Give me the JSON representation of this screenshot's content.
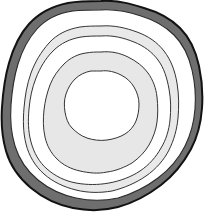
{
  "figure": {
    "width": 204,
    "height": 212,
    "background_color": "#ffffff"
  },
  "chart_data": {
    "type": "contour-rings",
    "xlabel": "",
    "ylabel": "",
    "center": [
      101,
      104
    ],
    "ring_count": 6,
    "outline_color": "#1a1a1a",
    "rings": [
      {
        "index": 0,
        "name": "outer-rind",
        "fill": "#6e6e6e",
        "stroke": "#121212",
        "stroke_width": 2.0,
        "mean_radius": 99,
        "radius_x": 99,
        "radius_y": 103,
        "roughness": "high",
        "label": "Outer rind"
      },
      {
        "index": 1,
        "name": "ring-1-white",
        "fill": "#ffffff",
        "stroke": "#2a2a2a",
        "stroke_width": 1.1,
        "mean_radius": 90,
        "radius_x": 90,
        "radius_y": 94,
        "roughness": "medium",
        "label": "Ring 1"
      },
      {
        "index": 2,
        "name": "ring-2-gray",
        "fill": "#e9e9e9",
        "stroke": "#333333",
        "stroke_width": 1.0,
        "mean_radius": 76,
        "radius_x": 76,
        "radius_y": 79,
        "roughness": "medium",
        "label": "Ring 2"
      },
      {
        "index": 3,
        "name": "ring-3-white",
        "fill": "#ffffff",
        "stroke": "#333333",
        "stroke_width": 1.0,
        "mean_radius": 66,
        "radius_x": 66,
        "radius_y": 69,
        "roughness": "low",
        "label": "Ring 3"
      },
      {
        "index": 4,
        "name": "ring-4-gray",
        "fill": "#e7e7e7",
        "stroke": "#333333",
        "stroke_width": 1.0,
        "mean_radius": 52,
        "radius_x": 52,
        "radius_y": 55,
        "roughness": "low",
        "label": "Ring 4"
      },
      {
        "index": 5,
        "name": "core-white",
        "fill": "#ffffff",
        "stroke": "#333333",
        "stroke_width": 1.0,
        "mean_radius": 33,
        "radius_x": 33,
        "radius_y": 34,
        "roughness": "low",
        "label": "Core"
      }
    ],
    "ring_paths": {
      "outer-rind": "M 101 1 C 118 0 131 4 144 8 C 158 12 170 18 180 28 C 190 38 196 52 199 66 C 202 80 203 94 202 108 C 201 122 198 136 191 149 C 184 162 174 175 161 185 C 148 195 133 203 118 207 C 103 211 88 211 73 208 C 58 205 43 198 31 188 C 19 178 10 165 6 151 C 2 137 1 122 2 107 C 3 92 5 77 9 63 C 13 49 19 35 29 24 C 39 13 53 6 68 3 C 79 1 90 1 101 1 Z",
      "ring-1-white": "M 101 10 C 116 9 129 12 141 16 C 154 20 165 26 174 35 C 183 44 189 57 192 70 C 195 83 196 96 195 109 C 194 122 191 134 185 146 C 179 158 170 169 158 178 C 146 187 132 194 118 198 C 104 201 90 201 76 198 C 62 195 49 189 38 180 C 27 171 19 159 15 146 C 11 133 10 119 11 105 C 12 91 14 77 18 64 C 22 51 28 39 37 29 C 46 19 59 13 73 11 C 83 10 92 10 101 10 Z",
      "ring-2-gray": "M 101 26 C 114 25 126 28 137 32 C 148 36 157 42 164 51 C 171 60 175 71 177 83 C 179 95 179 107 178 118 C 177 129 174 140 169 150 C 164 160 156 169 146 176 C 136 183 124 188 112 191 C 100 193 88 193 76 190 C 64 187 53 182 44 174 C 35 166 29 156 26 144 C 23 132 23 120 24 108 C 25 96 27 84 31 73 C 35 62 41 52 49 43 C 57 34 68 29 80 27 C 87 26 94 26 101 26 Z",
      "ring-3-white": "M 101 36 C 113 35 124 38 134 42 C 144 46 152 52 158 60 C 164 68 167 78 169 89 C 171 100 171 110 170 120 C 169 130 166 140 161 148 C 156 157 149 165 140 171 C 131 177 120 181 109 183 C 98 185 87 185 76 183 C 65 181 55 176 47 169 C 39 162 34 153 31 142 C 28 131 28 120 29 109 C 30 98 32 88 36 78 C 40 68 45 59 53 51 C 61 43 70 39 81 37 C 88 36 95 36 101 36 Z",
      "ring-4-gray": "M 101 52 C 111 51 120 53 128 57 C 136 61 143 66 148 73 C 153 80 156 88 157 97 C 158 106 158 114 157 122 C 156 130 153 138 149 145 C 145 152 139 158 132 163 C 125 167 116 171 107 172 C 98 174 89 173 80 171 C 71 169 63 165 57 159 C 51 153 47 146 45 137 C 43 128 43 119 44 110 C 45 101 47 93 50 85 C 53 77 58 70 64 64 C 70 58 78 54 86 53 C 91 52 96 52 101 52 Z",
      "core-white": "M 101 71 C 108 70 115 72 121 75 C 127 78 131 82 134 87 C 137 92 139 98 139 104 C 139 110 138 116 136 121 C 134 126 130 131 125 134 C 120 137 114 139 107 140 C 100 141 93 140 87 138 C 81 136 76 132 72 128 C 68 124 66 118 65 112 C 64 106 64 100 66 94 C 68 88 71 83 75 79 C 79 75 85 72 91 71 C 95 71 98 71 101 71 Z"
    }
  }
}
